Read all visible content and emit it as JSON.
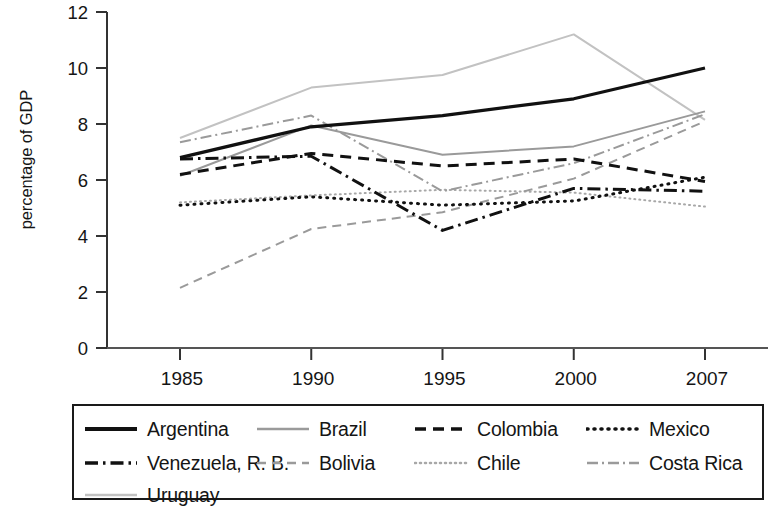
{
  "chart_data": {
    "type": "line",
    "title": "",
    "xlabel": "",
    "ylabel": "percentage of GDP",
    "x": [
      1985,
      1990,
      1995,
      2000,
      2007
    ],
    "xtick_labels": [
      "1985",
      "1990",
      "1995",
      "2000",
      "2007"
    ],
    "ytick_labels": [
      "0",
      "2",
      "4",
      "6",
      "8",
      "10",
      "12"
    ],
    "ytick_values": [
      0,
      2,
      4,
      6,
      8,
      10,
      12
    ],
    "ylim": [
      0,
      12
    ],
    "grid": false,
    "legend_position": "bottom",
    "series": [
      {
        "name": "Argentina",
        "values": [
          6.8,
          7.9,
          8.3,
          8.9,
          10.0
        ],
        "style": "solid",
        "color": "#111111",
        "width": 3.2,
        "dash": ""
      },
      {
        "name": "Brazil",
        "values": [
          6.15,
          7.95,
          6.9,
          7.2,
          8.45
        ],
        "style": "solid",
        "color": "#9a9a9a",
        "width": 2.0,
        "dash": ""
      },
      {
        "name": "Colombia",
        "values": [
          6.2,
          6.95,
          6.5,
          6.75,
          5.95
        ],
        "style": "dashed",
        "color": "#111111",
        "width": 3.0,
        "dash": "11,7"
      },
      {
        "name": "Mexico",
        "values": [
          5.1,
          5.4,
          5.1,
          5.25,
          6.1
        ],
        "style": "dotted",
        "color": "#111111",
        "width": 3.0,
        "dash": "1,6"
      },
      {
        "name": "Venezuela, R. B.",
        "values": [
          6.75,
          6.85,
          4.2,
          5.7,
          5.6
        ],
        "style": "dash-dot",
        "color": "#111111",
        "width": 3.0,
        "dash": "13,5,2.5,5"
      },
      {
        "name": "Bolivia",
        "values": [
          2.15,
          4.25,
          4.85,
          6.05,
          8.1
        ],
        "style": "dashed",
        "color": "#9a9a9a",
        "width": 2.0,
        "dash": "9,6"
      },
      {
        "name": "Chile",
        "values": [
          5.2,
          5.45,
          5.65,
          5.55,
          5.05
        ],
        "style": "dotted",
        "color": "#a8a8a8",
        "width": 2.0,
        "dash": "1,4"
      },
      {
        "name": "Costa Rica",
        "values": [
          7.35,
          8.3,
          5.6,
          6.6,
          8.35
        ],
        "style": "dash-dot",
        "color": "#9a9a9a",
        "width": 2.0,
        "dash": "11,4,2,4"
      },
      {
        "name": "Uruguay",
        "values": [
          7.5,
          9.3,
          9.75,
          11.2,
          8.15
        ],
        "style": "solid",
        "color": "#c2c2c2",
        "width": 2.0,
        "dash": ""
      }
    ]
  },
  "axis": {
    "ylabel_text": "percentage of GDP"
  },
  "legend": {
    "items": [
      {
        "label": "Argentina"
      },
      {
        "label": "Brazil"
      },
      {
        "label": "Colombia"
      },
      {
        "label": "Mexico"
      },
      {
        "label": "Venezuela, R. B."
      },
      {
        "label": "Bolivia"
      },
      {
        "label": "Chile"
      },
      {
        "label": "Costa Rica"
      },
      {
        "label": "Uruguay"
      }
    ]
  }
}
